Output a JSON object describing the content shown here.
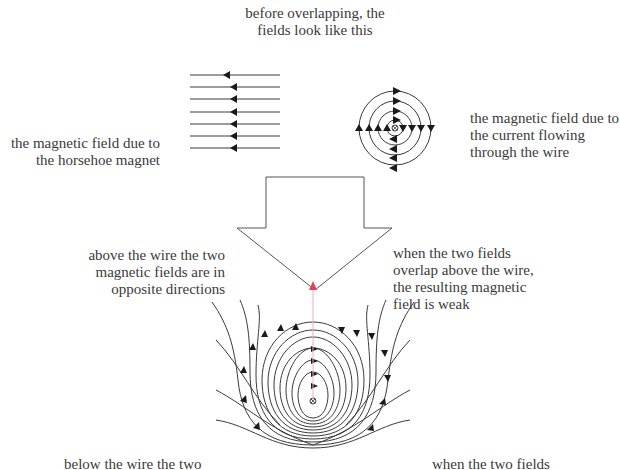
{
  "labels": {
    "title": "before overlapping, the\nfields look like this",
    "magnet_field": "the magnetic field due to\nthe horsehoe magnet",
    "wire_field": "the magnetic field due to\nthe current flowing\nthrough the wire",
    "overlap_arrow": "when the\nmagnetic\nfields\noverlap",
    "above_opposite": "above the wire the two\nmagnetic fields are in\nopposite directions",
    "above_weak": "when the two fields\noverlap above the wire,\nthe resulting magnetic\nfield is weak",
    "below_left": "below the wire the two",
    "below_right": "when the two fields"
  },
  "diagrams": {
    "magnet_field": {
      "line_count": 7,
      "direction": "left"
    },
    "wire_field": {
      "ring_count": 4,
      "center_symbol": "⊗"
    },
    "combined_field": {
      "center_symbol": "⊗"
    }
  },
  "colors": {
    "line": "#3a3a3a",
    "text": "#3a3a3a",
    "red_arrow": "#e0405a"
  }
}
